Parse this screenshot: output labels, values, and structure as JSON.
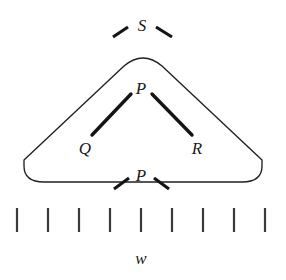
{
  "figure": {
    "background_color": "#ffffff",
    "ink_color": "#1a1a1a",
    "width": 286,
    "height": 280
  },
  "labels": {
    "s_node": "S",
    "p_node": "P",
    "q_node": "Q",
    "r_node": "R",
    "p_boundary": "P",
    "w_axis": "w"
  },
  "constituent": {
    "shape": "rounded-triangle",
    "apex": {
      "x": 143,
      "y": 57
    },
    "bottom_y": 182,
    "left_x": 24,
    "right_x": 262,
    "corner_radius": 26,
    "stroke_color": "#1f1f1f",
    "stroke_width": 1.35
  },
  "branches": [
    {
      "name": "branch-p-q",
      "from": {
        "x": 131,
        "y": 94
      },
      "to": {
        "x": 92,
        "y": 135
      },
      "stroke_color": "#141414",
      "stroke_width": 3.4
    },
    {
      "name": "branch-p-r",
      "from": {
        "x": 152,
        "y": 94
      },
      "to": {
        "x": 192,
        "y": 135
      },
      "stroke_color": "#141414",
      "stroke_width": 3.4
    }
  ],
  "boundary_ticks": {
    "s_left": {
      "x1": 113,
      "y1": 37,
      "x2": 128,
      "y2": 27
    },
    "s_right": {
      "x1": 156,
      "y1": 27,
      "x2": 172,
      "y2": 37
    },
    "p_left": {
      "x1": 114,
      "y1": 189,
      "x2": 129,
      "y2": 178
    },
    "p_right": {
      "x1": 154,
      "y1": 178,
      "x2": 169,
      "y2": 189
    }
  },
  "scale": {
    "axis_label": "w",
    "tick_count": 9,
    "tick_positions": [
      17,
      48,
      79,
      110,
      141,
      172,
      203,
      234,
      265
    ],
    "tick_top_y": 208,
    "tick_bottom_y": 232,
    "tick_color": "#3a3a3a"
  },
  "label_positions": {
    "s_node": {
      "x": 142,
      "y": 31
    },
    "p_node": {
      "x": 141,
      "y": 94
    },
    "q_node": {
      "x": 85,
      "y": 154
    },
    "r_node": {
      "x": 197,
      "y": 154
    },
    "p_boundary": {
      "x": 141,
      "y": 181
    },
    "w_axis": {
      "x": 141,
      "y": 264
    }
  }
}
